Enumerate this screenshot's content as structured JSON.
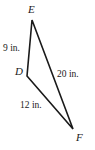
{
  "figure": {
    "type": "triangle",
    "name": "triangle-DEF",
    "background_color": "#ffffff",
    "stroke_color": "#1a1a1a",
    "vertices": [
      {
        "id": "E",
        "label": "E",
        "x": 32,
        "y": 20
      },
      {
        "id": "D",
        "label": "D",
        "x": 27,
        "y": 76
      },
      {
        "id": "F",
        "label": "F",
        "x": 73,
        "y": 129
      }
    ],
    "sides": [
      {
        "id": "DE",
        "from": "D",
        "to": "E",
        "label": "9 in.",
        "length": 9,
        "unit": "in."
      },
      {
        "id": "EF",
        "from": "E",
        "to": "F",
        "label": "20 in.",
        "length": 20,
        "unit": "in."
      },
      {
        "id": "DF",
        "from": "D",
        "to": "F",
        "label": "12 in.",
        "length": 12,
        "unit": "in."
      }
    ]
  },
  "chart_data": {
    "type": "diagram",
    "title": "",
    "categories": [
      "DE",
      "EF",
      "DF"
    ],
    "values": [
      9,
      20,
      12
    ],
    "units": "in.",
    "labels": [
      "9 in.",
      "20 in.",
      "12 in."
    ],
    "vertex_labels": [
      "E",
      "D",
      "F"
    ]
  }
}
